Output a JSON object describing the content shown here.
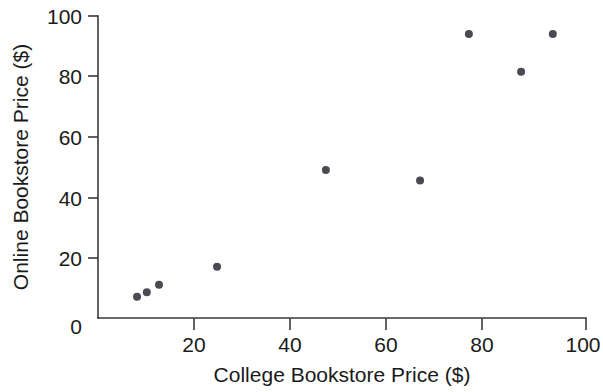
{
  "chart_data": {
    "type": "scatter",
    "title": "",
    "xlabel": "College Bookstore Price ($)",
    "ylabel": "Online Bookstore Price ($)",
    "xlim": [
      0,
      100
    ],
    "ylim": [
      0,
      100
    ],
    "grid": false,
    "legend": null,
    "xticks": [
      0,
      20,
      40,
      60,
      80,
      100
    ],
    "xtick_labels": [
      "0",
      "20",
      "40",
      "60",
      "80",
      "100"
    ],
    "yticks": [
      0,
      20,
      40,
      60,
      80,
      100
    ],
    "ytick_labels": [
      "0",
      "20",
      "40",
      "60",
      "80",
      "100"
    ],
    "marker": "circle",
    "marker_color": "#4a4a52",
    "marker_size": 4,
    "points": [
      {
        "x": 8.0,
        "y": 7.0
      },
      {
        "x": 10.0,
        "y": 8.5
      },
      {
        "x": 12.5,
        "y": 11.0
      },
      {
        "x": 24.4,
        "y": 17.0
      },
      {
        "x": 46.7,
        "y": 49.0
      },
      {
        "x": 66.0,
        "y": 45.5
      },
      {
        "x": 76.0,
        "y": 94.0
      },
      {
        "x": 86.7,
        "y": 81.5
      },
      {
        "x": 93.2,
        "y": 94.0
      }
    ],
    "x": [
      8.0,
      10.0,
      12.5,
      24.4,
      46.7,
      66.0,
      76.0,
      86.7,
      93.2
    ],
    "values": [
      7.0,
      8.5,
      11.0,
      17.0,
      49.0,
      45.5,
      94.0,
      81.5,
      94.0
    ]
  },
  "axes": {
    "x_title": "College Bookstore Price ($)",
    "y_title": "Online Bookstore Price ($)",
    "x_origin_label": "0",
    "y_origin_label": "0"
  },
  "colors": {
    "marker": "#4a4a52",
    "axis": "#3a3a3a",
    "text": "#1a1a1a",
    "background": "#ffffff"
  }
}
